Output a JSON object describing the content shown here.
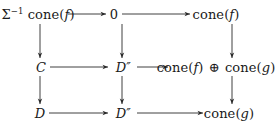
{
  "diagram": {
    "kind": "commutative-diagram",
    "background_color": "#ffffff",
    "line_color": "#2a2a2a",
    "rows": 3,
    "columns": 3,
    "nodes": [
      {
        "id": "r1c1",
        "row": 1,
        "col": 1,
        "label": "Σ⁻¹ cone(f)"
      },
      {
        "id": "r1c2",
        "row": 1,
        "col": 2,
        "label": "0"
      },
      {
        "id": "r1c3",
        "row": 1,
        "col": 3,
        "label": "cone(f)"
      },
      {
        "id": "r2c1",
        "row": 2,
        "col": 1,
        "label": "C"
      },
      {
        "id": "r2c2",
        "row": 2,
        "col": 2,
        "label": "D″"
      },
      {
        "id": "r2c3",
        "row": 2,
        "col": 3,
        "label": "cone(f) ⊕ cone(g)"
      },
      {
        "id": "r3c1",
        "row": 3,
        "col": 1,
        "label": "D"
      },
      {
        "id": "r3c2",
        "row": 3,
        "col": 2,
        "label": "D″"
      },
      {
        "id": "r3c3",
        "row": 3,
        "col": 3,
        "label": "cone(g)"
      }
    ],
    "arrows": [
      {
        "from": "r1c1",
        "to": "r1c2",
        "direction": "right",
        "label": ""
      },
      {
        "from": "r1c2",
        "to": "r1c3",
        "direction": "right",
        "label": ""
      },
      {
        "from": "r2c1",
        "to": "r2c2",
        "direction": "right",
        "label": ""
      },
      {
        "from": "r2c2",
        "to": "r2c3",
        "direction": "right",
        "label": ""
      },
      {
        "from": "r3c1",
        "to": "r3c2",
        "direction": "right",
        "label": ""
      },
      {
        "from": "r3c2",
        "to": "r3c3",
        "direction": "right",
        "label": ""
      },
      {
        "from": "r1c1",
        "to": "r2c1",
        "direction": "down",
        "label": ""
      },
      {
        "from": "r2c1",
        "to": "r3c1",
        "direction": "down",
        "label": ""
      },
      {
        "from": "r1c2",
        "to": "r2c2",
        "direction": "down",
        "label": ""
      },
      {
        "from": "r2c2",
        "to": "r3c2",
        "direction": "down",
        "label": ""
      },
      {
        "from": "r1c3",
        "to": "r2c3",
        "direction": "down",
        "label": ""
      },
      {
        "from": "r2c3",
        "to": "r3c3",
        "direction": "down",
        "label": ""
      }
    ]
  }
}
